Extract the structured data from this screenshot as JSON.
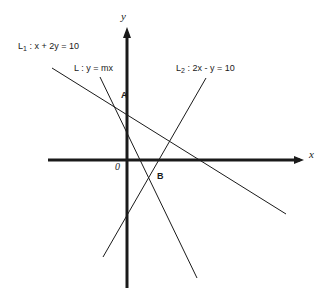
{
  "figure": {
    "background_color": "#ffffff",
    "stroke_color": "#1a1a1a"
  },
  "axes": {
    "x_label": "x",
    "y_label": "y",
    "origin_label": "0",
    "x_axis": {
      "x1": 48,
      "y1": 160,
      "x2": 304,
      "y2": 160,
      "arrow": "right",
      "width": 3
    },
    "y_axis": {
      "x1": 127,
      "y1": 288,
      "x2": 127,
      "y2": 28,
      "arrow": "up",
      "width": 3
    }
  },
  "lines": [
    {
      "id": "L1",
      "label": "L₁ : x + 2y = 10",
      "label_main": "L",
      "label_sub": "1",
      "label_rest": " : x + 2y = 10",
      "equation": "x + 2y = 10",
      "slope": -0.5,
      "x1": 52,
      "y1": 68,
      "x2": 286,
      "y2": 214,
      "width": 1
    },
    {
      "id": "L",
      "label": "L : y = mx",
      "label_main": "L",
      "label_sub": "",
      "label_rest": " : y = mx",
      "equation": "y = mx",
      "slope": "m",
      "x1": 100,
      "y1": 77,
      "x2": 197,
      "y2": 278,
      "width": 1
    },
    {
      "id": "L2",
      "label": "L₂ : 2x - y = 10",
      "label_main": "L",
      "label_sub": "2",
      "label_rest": " : 2x - y = 10",
      "equation": "2x - y = 10",
      "slope": 2,
      "x1": 103,
      "y1": 257,
      "x2": 206,
      "y2": 78,
      "width": 1
    }
  ],
  "points": [
    {
      "name": "A",
      "label": "A",
      "x": 119,
      "y": 99,
      "description": "intersection of L and L1"
    },
    {
      "name": "B",
      "label": "B",
      "x": 152,
      "y": 177,
      "description": "intersection of L and L2"
    }
  ],
  "chart_data": {
    "type": "line",
    "xlabel": "x",
    "ylabel": "y",
    "grid": false,
    "legend": "inline-labels",
    "series": [
      {
        "name": "L₁ : x + 2y = 10",
        "equation": "x + 2y = 10",
        "slope": -0.5,
        "intercept": 5
      },
      {
        "name": "L : y = mx",
        "equation": "y = mx",
        "slope": "m",
        "intercept": 0
      },
      {
        "name": "L₂ : 2x - y = 10",
        "equation": "2x - y = 10",
        "slope": 2,
        "intercept": -10
      }
    ],
    "annotations": [
      {
        "text": "A",
        "meaning": "intersection of L and L₁"
      },
      {
        "text": "B",
        "meaning": "intersection of L and L₂"
      },
      {
        "text": "0",
        "meaning": "origin"
      }
    ]
  }
}
